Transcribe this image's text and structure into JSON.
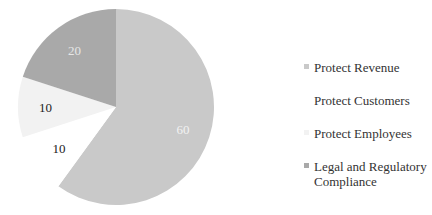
{
  "chart_data": {
    "type": "pie",
    "title": "",
    "start_angle_deg": 0,
    "direction": "clockwise",
    "slices": [
      {
        "label": "Protect Revenue",
        "value": 60,
        "color": "#c9c9c9",
        "label_color": "#f2f2f2"
      },
      {
        "label": "Protect Customers",
        "value": 10,
        "color": "#ffffff",
        "label_color": "#222222"
      },
      {
        "label": "Protect Employees",
        "value": 10,
        "color": "#f2f2f2",
        "label_color": "#222222"
      },
      {
        "label": "Legal and Regulatory Compliance",
        "value": 20,
        "color": "#a9a9a9",
        "label_color": "#e6e6e6"
      }
    ],
    "legend_position": "right"
  },
  "legend": {
    "items": [
      {
        "label": "Protect Revenue",
        "color": "#c9c9c9",
        "top": 0
      },
      {
        "label": "Protect Customers",
        "color": "#ffffff",
        "top": 33
      },
      {
        "label": "Protect Employees",
        "color": "#f2f2f2",
        "top": 66
      },
      {
        "label": "Legal and Regulatory Compliance",
        "color": "#a9a9a9",
        "top": 99
      }
    ]
  }
}
